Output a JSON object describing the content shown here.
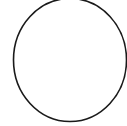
{
  "canvas": {
    "width": 127,
    "height": 126,
    "background": "#ffffff"
  },
  "shape": {
    "type": "ellipse",
    "cx": 70,
    "cy": 60,
    "rx": 56.5,
    "ry": 61.5,
    "stroke": "#1a1a1a",
    "stroke_width": 1.6,
    "fill": "none"
  }
}
